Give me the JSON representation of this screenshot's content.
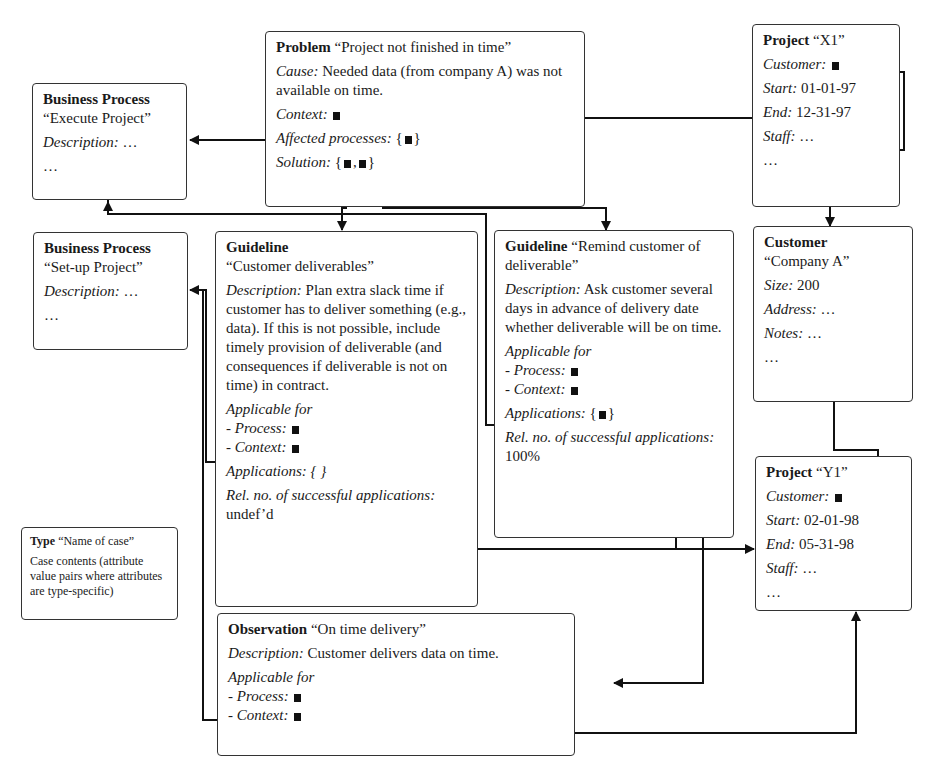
{
  "problem": {
    "type": "Problem",
    "name": "“Project not finished in time”",
    "cause_label": "Cause:",
    "cause_value": "Needed data (from company A) was not available on time.",
    "context_label": "Context:",
    "affected_label": "Affected processes:",
    "solution_label": "Solution:"
  },
  "bp_execute": {
    "type": "Business Process",
    "name": "“Execute Project”",
    "desc_label": "Description:",
    "desc_value": "…",
    "more": "…"
  },
  "bp_setup": {
    "type": "Business Process",
    "name": "“Set-up Project”",
    "desc_label": "Description:",
    "desc_value": "…",
    "more": "…"
  },
  "project_x1": {
    "type": "Project",
    "name": "“X1”",
    "customer_label": "Customer:",
    "start_label": "Start:",
    "start_value": "01-01-97",
    "end_label": "End:",
    "end_value": "12-31-97",
    "staff_label": "Staff:",
    "staff_value": "…",
    "more": "…"
  },
  "customer": {
    "type": "Customer",
    "name": "“Company A”",
    "size_label": "Size:",
    "size_value": "200",
    "address_label": "Address:",
    "address_value": "…",
    "notes_label": "Notes:",
    "notes_value": "…",
    "more": "…"
  },
  "project_y1": {
    "type": "Project",
    "name": "“Y1”",
    "customer_label": "Customer:",
    "start_label": "Start:",
    "start_value": "02-01-98",
    "end_label": "End:",
    "end_value": "05-31-98",
    "staff_label": "Staff:",
    "staff_value": "…",
    "more": "…"
  },
  "guideline_cd": {
    "type": "Guideline",
    "name": "“Customer deliverables”",
    "desc_label": "Description:",
    "desc_value": "Plan extra slack time if customer has to deliver something (e.g., data). If this is not possible, include timely provision of deliverable (and consequences if deliverable is not on time) in contract.",
    "applicable_label": "Applicable for",
    "process_label": "- Process:",
    "context_label": "- Context:",
    "applications_label": "Applications:",
    "applications_value": "{ }",
    "rel_label": "Rel. no. of successful applications:",
    "rel_value": "undef’d"
  },
  "guideline_rc": {
    "type": "Guideline",
    "name": "“Remind customer of deliverable”",
    "desc_label": "Description:",
    "desc_value": "Ask customer several days in advance of delivery date whether deliverable will be on time.",
    "applicable_label": "Applicable for",
    "process_label": "- Process:",
    "context_label": "- Context:",
    "applications_label": "Applications:",
    "rel_label": "Rel. no. of successful applications:",
    "rel_value": "100%"
  },
  "observation": {
    "type": "Observation",
    "name": "“On time delivery”",
    "desc_label": "Description:",
    "desc_value": "Customer delivers data on time.",
    "applicable_label": "Applicable for",
    "process_label": "- Process:",
    "context_label": "- Context:"
  },
  "legend": {
    "type": "Type",
    "name": "“Name of case”",
    "contents": "Case contents (attribute value pairs where attributes are type-specific)"
  }
}
